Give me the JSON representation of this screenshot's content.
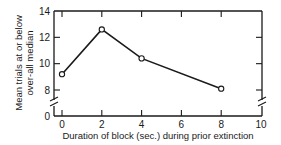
{
  "chart_data": {
    "type": "line",
    "title": "",
    "xlabel": "Duration of block (sec.) during prior extinction",
    "ylabel": [
      "Mean trials at or below",
      "over-all median"
    ],
    "x": [
      0,
      2,
      4,
      8
    ],
    "series": [
      {
        "name": "Mean trials",
        "values": [
          9.2,
          12.6,
          10.4,
          8.1
        ],
        "marker": "open-circle"
      }
    ],
    "xlim": [
      0,
      10
    ],
    "ylim": [
      0,
      14
    ],
    "x_ticks": [
      0,
      2,
      4,
      6,
      8,
      10
    ],
    "y_ticks": [
      0,
      8,
      10,
      12,
      14
    ],
    "y_axis_break": "between 0 and 8",
    "grid": false,
    "legend": "none",
    "frame": "box with inward ticks on all sides"
  },
  "colors": {
    "line": "#1a1a1a",
    "background": "#ffffff"
  }
}
